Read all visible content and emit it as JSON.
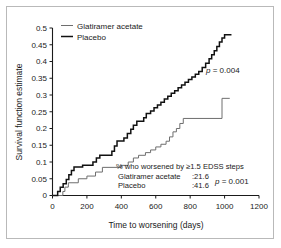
{
  "chart_data": {
    "type": "line",
    "subtype": "kaplan-meier-step",
    "title": "",
    "xlabel": "Time to worsening (days)",
    "ylabel": "Survival function estimate",
    "xlim": [
      0,
      1200
    ],
    "ylim": [
      0,
      0.5
    ],
    "xticks": [
      0,
      200,
      400,
      600,
      800,
      1000,
      1200
    ],
    "xtick_labels": [
      "0",
      "200",
      "400",
      "600",
      "800",
      "1000",
      "1200"
    ],
    "yticks": [
      0,
      0.05,
      0.1,
      0.15,
      0.2,
      0.25,
      0.3,
      0.35,
      0.4,
      0.45,
      0.5
    ],
    "ytick_labels": [
      "0",
      "0.05",
      "0.1",
      "0.15",
      "0.2",
      "0.25",
      "0.3",
      "0.35",
      "0.4",
      "0.45",
      "0.5"
    ],
    "grid": false,
    "legend_position": "top-left",
    "series": [
      {
        "name": "Glatiramer acetate",
        "style": "thin",
        "color": "#6e6e6e",
        "points": [
          [
            0,
            0
          ],
          [
            60,
            0
          ],
          [
            60,
            0.012
          ],
          [
            72,
            0.012
          ],
          [
            72,
            0.025
          ],
          [
            92,
            0.025
          ],
          [
            92,
            0.038
          ],
          [
            150,
            0.038
          ],
          [
            150,
            0.05
          ],
          [
            200,
            0.05
          ],
          [
            200,
            0.058
          ],
          [
            250,
            0.058
          ],
          [
            250,
            0.07
          ],
          [
            290,
            0.07
          ],
          [
            290,
            0.084
          ],
          [
            400,
            0.084
          ],
          [
            400,
            0.09
          ],
          [
            440,
            0.09
          ],
          [
            440,
            0.1
          ],
          [
            470,
            0.1
          ],
          [
            470,
            0.112
          ],
          [
            500,
            0.112
          ],
          [
            500,
            0.12
          ],
          [
            540,
            0.12
          ],
          [
            540,
            0.128
          ],
          [
            570,
            0.128
          ],
          [
            570,
            0.136
          ],
          [
            600,
            0.136
          ],
          [
            600,
            0.145
          ],
          [
            630,
            0.145
          ],
          [
            630,
            0.153
          ],
          [
            660,
            0.153
          ],
          [
            660,
            0.162
          ],
          [
            680,
            0.162
          ],
          [
            680,
            0.175
          ],
          [
            700,
            0.175
          ],
          [
            700,
            0.19
          ],
          [
            720,
            0.19
          ],
          [
            720,
            0.2
          ],
          [
            740,
            0.2
          ],
          [
            740,
            0.215
          ],
          [
            760,
            0.215
          ],
          [
            760,
            0.23
          ],
          [
            985,
            0.23
          ],
          [
            985,
            0.29
          ],
          [
            1030,
            0.29
          ]
        ]
      },
      {
        "name": "Placebo",
        "style": "thick",
        "color": "#111111",
        "points": [
          [
            0,
            0
          ],
          [
            30,
            0
          ],
          [
            30,
            0.012
          ],
          [
            45,
            0.012
          ],
          [
            45,
            0.025
          ],
          [
            62,
            0.025
          ],
          [
            62,
            0.035
          ],
          [
            80,
            0.035
          ],
          [
            80,
            0.048
          ],
          [
            95,
            0.048
          ],
          [
            95,
            0.062
          ],
          [
            110,
            0.062
          ],
          [
            110,
            0.075
          ],
          [
            125,
            0.075
          ],
          [
            125,
            0.085
          ],
          [
            175,
            0.085
          ],
          [
            175,
            0.09
          ],
          [
            235,
            0.09
          ],
          [
            235,
            0.1
          ],
          [
            255,
            0.1
          ],
          [
            255,
            0.112
          ],
          [
            275,
            0.112
          ],
          [
            275,
            0.12
          ],
          [
            345,
            0.12
          ],
          [
            345,
            0.132
          ],
          [
            360,
            0.132
          ],
          [
            360,
            0.148
          ],
          [
            375,
            0.148
          ],
          [
            375,
            0.163
          ],
          [
            415,
            0.163
          ],
          [
            415,
            0.172
          ],
          [
            435,
            0.172
          ],
          [
            435,
            0.185
          ],
          [
            455,
            0.185
          ],
          [
            455,
            0.198
          ],
          [
            470,
            0.198
          ],
          [
            470,
            0.21
          ],
          [
            490,
            0.21
          ],
          [
            490,
            0.222
          ],
          [
            530,
            0.222
          ],
          [
            530,
            0.232
          ],
          [
            545,
            0.232
          ],
          [
            545,
            0.245
          ],
          [
            570,
            0.245
          ],
          [
            570,
            0.252
          ],
          [
            590,
            0.252
          ],
          [
            590,
            0.262
          ],
          [
            610,
            0.262
          ],
          [
            610,
            0.27
          ],
          [
            630,
            0.27
          ],
          [
            630,
            0.278
          ],
          [
            650,
            0.278
          ],
          [
            650,
            0.288
          ],
          [
            670,
            0.288
          ],
          [
            670,
            0.296
          ],
          [
            690,
            0.296
          ],
          [
            690,
            0.305
          ],
          [
            710,
            0.305
          ],
          [
            710,
            0.313
          ],
          [
            730,
            0.313
          ],
          [
            730,
            0.322
          ],
          [
            750,
            0.322
          ],
          [
            750,
            0.33
          ],
          [
            770,
            0.33
          ],
          [
            770,
            0.338
          ],
          [
            790,
            0.338
          ],
          [
            790,
            0.346
          ],
          [
            810,
            0.346
          ],
          [
            810,
            0.354
          ],
          [
            830,
            0.354
          ],
          [
            830,
            0.362
          ],
          [
            850,
            0.362
          ],
          [
            850,
            0.37
          ],
          [
            870,
            0.37
          ],
          [
            870,
            0.382
          ],
          [
            890,
            0.382
          ],
          [
            890,
            0.395
          ],
          [
            910,
            0.395
          ],
          [
            910,
            0.408
          ],
          [
            925,
            0.408
          ],
          [
            925,
            0.42
          ],
          [
            940,
            0.42
          ],
          [
            940,
            0.432
          ],
          [
            955,
            0.432
          ],
          [
            955,
            0.445
          ],
          [
            970,
            0.445
          ],
          [
            970,
            0.458
          ],
          [
            985,
            0.458
          ],
          [
            985,
            0.47
          ],
          [
            1000,
            0.47
          ],
          [
            1000,
            0.48
          ],
          [
            1040,
            0.48
          ]
        ]
      }
    ],
    "annotations": [
      {
        "name": "p-value-overall",
        "text_italic": "p",
        "text": " = 0.004",
        "x_data": 880,
        "y_data": 0.385
      }
    ],
    "stats_box": {
      "header": "% who worsened by ≥1.5 EDSS steps",
      "rows": [
        {
          "label": "Glatiramer acetate",
          "value": ":21.6"
        },
        {
          "label": "Placebo",
          "value": ":41.6"
        }
      ],
      "pvalue_italic": "p",
      "pvalue_text": " = 0.001"
    }
  },
  "legend": {
    "items": [
      {
        "label": "Glatiramer acetate",
        "style": "thin"
      },
      {
        "label": "Placebo",
        "style": "thick"
      }
    ]
  }
}
